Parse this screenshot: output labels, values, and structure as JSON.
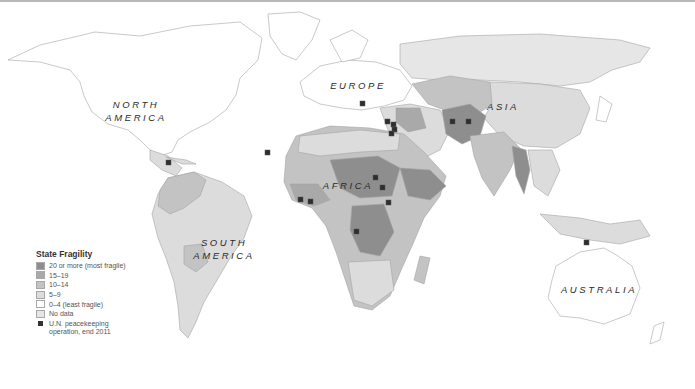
{
  "map": {
    "continent_labels": {
      "north_america": [
        "NORTH",
        "AMERICA"
      ],
      "south_america": [
        "SOUTH",
        "AMERICA"
      ],
      "europe": "EUROPE",
      "africa": "AFRICA",
      "asia": "ASIA",
      "australia": "AUSTRALIA"
    },
    "colors": {
      "most_fragile": "#8e8e8e",
      "high": "#a9a9a9",
      "medium": "#c3c3c3",
      "low": "#dcdcdc",
      "least": "#ffffff",
      "no_data": "#e6e6e6",
      "border": "#a5a5a5",
      "marker": "#2e2e2e"
    }
  },
  "legend": {
    "title": "State Fragility",
    "items": [
      {
        "label": "20 or more (most fragile)",
        "color": "#8e8e8e"
      },
      {
        "label": "15–19",
        "color": "#a9a9a9"
      },
      {
        "label": "10–14",
        "color": "#c3c3c3"
      },
      {
        "label": "5–9",
        "color": "#dcdcdc"
      },
      {
        "label": "0–4 (least fragile)",
        "color": "#ffffff"
      },
      {
        "label": "No data",
        "color": "#e6e6e6"
      }
    ],
    "peacekeeping": {
      "line1": "U.N. peacekeeping",
      "line2": "operation, end 2011"
    }
  }
}
